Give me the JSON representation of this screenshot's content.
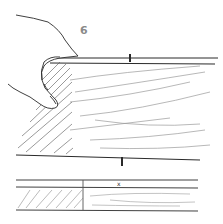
{
  "figure": {
    "number": "6",
    "ink_color": "#2a2a2a",
    "hatch_color": "#555555",
    "grain_color": "#9a9a9a",
    "number_color": "#8a8a8a",
    "marks": {
      "upper_tick": "|",
      "middle_tick": "|",
      "lower_mark": "x"
    }
  }
}
